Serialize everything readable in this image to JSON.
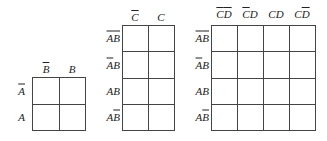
{
  "maps": [
    {
      "id": "two-variable",
      "col_labels": [
        {
          "var": "B",
          "bar": true
        },
        {
          "var": "B",
          "bar": false
        }
      ],
      "row_labels": [
        {
          "var": "A",
          "bar": true
        },
        {
          "var": "A",
          "bar": false
        }
      ],
      "cells": [
        [
          "",
          ""
        ],
        [
          "",
          ""
        ]
      ]
    },
    {
      "id": "three-variable",
      "col_labels": [
        {
          "var": "C",
          "bar": true
        },
        {
          "var": "C",
          "bar": false
        }
      ],
      "row_labels": [
        {
          "text": "AB",
          "bars": [
            true,
            true
          ]
        },
        {
          "text": "AB",
          "bars": [
            true,
            false
          ]
        },
        {
          "text": "AB",
          "bars": [
            false,
            false
          ]
        },
        {
          "text": "AB",
          "bars": [
            false,
            true
          ]
        }
      ],
      "cells": [
        [
          "",
          ""
        ],
        [
          "",
          ""
        ],
        [
          "",
          ""
        ],
        [
          "",
          ""
        ]
      ]
    },
    {
      "id": "four-variable",
      "col_labels": [
        {
          "text": "CD",
          "bars": [
            true,
            true
          ]
        },
        {
          "text": "CD",
          "bars": [
            true,
            false
          ]
        },
        {
          "text": "CD",
          "bars": [
            false,
            false
          ]
        },
        {
          "text": "CD",
          "bars": [
            false,
            true
          ]
        }
      ],
      "row_labels": [
        {
          "text": "AB",
          "bars": [
            true,
            true
          ]
        },
        {
          "text": "AB",
          "bars": [
            true,
            false
          ]
        },
        {
          "text": "AB",
          "bars": [
            false,
            false
          ]
        },
        {
          "text": "AB",
          "bars": [
            false,
            true
          ]
        }
      ],
      "cells": [
        [
          "",
          "",
          "",
          ""
        ],
        [
          "",
          "",
          "",
          ""
        ],
        [
          "",
          "",
          "",
          ""
        ],
        [
          "",
          "",
          "",
          ""
        ]
      ]
    }
  ]
}
